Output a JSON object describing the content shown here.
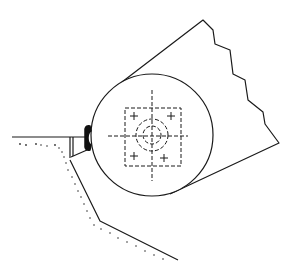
{
  "diagram": {
    "type": "technical line drawing",
    "colors": {
      "background": "#ffffff",
      "stroke": "#1a1a1a"
    },
    "elements": [
      {
        "id": "cylinder-end-circle",
        "label": "circle",
        "cx": 152,
        "cy": 135,
        "r": 61
      },
      {
        "id": "cylinder-body",
        "label": "cylinder body with jagged (broken) far edge"
      },
      {
        "id": "crosshair-reticle",
        "label": "dashed square with concentric dashed circles and crosshair"
      },
      {
        "id": "clip",
        "label": "black clip attachment"
      },
      {
        "id": "ground-ledge",
        "label": "horizontal ground line"
      },
      {
        "id": "trench-slope",
        "label": "sloped ground with stippled soil"
      }
    ]
  }
}
